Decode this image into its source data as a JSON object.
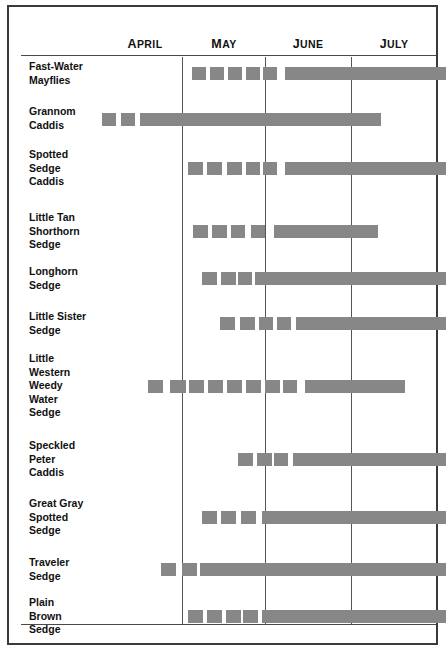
{
  "chart_data": {
    "type": "table",
    "title": "",
    "subtitle": "",
    "xlabel": "",
    "ylabel": "",
    "grid": true,
    "legend": null,
    "axis": {
      "months": [
        "April",
        "May",
        "June",
        "July"
      ],
      "month_labels": [
        "APRIL",
        "MAY",
        "JUNE",
        "JULY"
      ],
      "x_start_month": "April",
      "x_end_month": "July"
    },
    "note": "Emergence / hatch timing chart. Dashed (segmented) blocks indicate sparse or early emergence; solid blocks indicate peak continuous emergence.",
    "rows": [
      {
        "label": "Fast-Water\nMayflies",
        "dashes": [
          {
            "x": 183,
            "w": 14
          },
          {
            "x": 201,
            "w": 14
          },
          {
            "x": 219,
            "w": 14
          },
          {
            "x": 237,
            "w": 14
          },
          {
            "x": 254,
            "w": 14
          }
        ],
        "solid": {
          "x": 276,
          "w": 161
        }
      },
      {
        "label": "Grannom\nCaddis",
        "dashes": [
          {
            "x": 93,
            "w": 14
          },
          {
            "x": 112,
            "w": 14
          }
        ],
        "solid": {
          "x": 131,
          "w": 241
        }
      },
      {
        "label": "Spotted\nSedge\nCaddis",
        "dashes": [
          {
            "x": 179,
            "w": 15
          },
          {
            "x": 198,
            "w": 15
          },
          {
            "x": 218,
            "w": 15
          },
          {
            "x": 237,
            "w": 14
          },
          {
            "x": 254,
            "w": 14
          }
        ],
        "solid": {
          "x": 276,
          "w": 161
        }
      },
      {
        "label": "Little Tan\nShorthorn\nSedge",
        "dashes": [
          {
            "x": 184,
            "w": 15
          },
          {
            "x": 203,
            "w": 15
          },
          {
            "x": 222,
            "w": 14
          },
          {
            "x": 242,
            "w": 14
          }
        ],
        "solid": {
          "x": 265,
          "w": 104
        }
      },
      {
        "label": "Longhorn\nSedge",
        "dashes": [
          {
            "x": 193,
            "w": 15
          },
          {
            "x": 212,
            "w": 15
          },
          {
            "x": 229,
            "w": 14
          }
        ],
        "solid": {
          "x": 246,
          "w": 191
        }
      },
      {
        "label": "Little Sister\nSedge",
        "dashes": [
          {
            "x": 211,
            "w": 15
          },
          {
            "x": 231,
            "w": 15
          },
          {
            "x": 250,
            "w": 14
          },
          {
            "x": 268,
            "w": 14
          }
        ],
        "solid": {
          "x": 287,
          "w": 150
        }
      },
      {
        "label": "Little\nWestern\nWeedy\nWater\nSedge",
        "dashes": [
          {
            "x": 139,
            "w": 15
          },
          {
            "x": 161,
            "w": 16
          },
          {
            "x": 180,
            "w": 15
          },
          {
            "x": 199,
            "w": 15
          },
          {
            "x": 218,
            "w": 15
          },
          {
            "x": 237,
            "w": 15
          },
          {
            "x": 256,
            "w": 15
          },
          {
            "x": 274,
            "w": 14
          }
        ],
        "solid": {
          "x": 296,
          "w": 100
        }
      },
      {
        "label": "Speckled\nPeter\nCaddis",
        "dashes": [
          {
            "x": 229,
            "w": 15
          },
          {
            "x": 248,
            "w": 15
          },
          {
            "x": 265,
            "w": 14
          }
        ],
        "solid": {
          "x": 284,
          "w": 153
        }
      },
      {
        "label": "Great Gray\nSpotted\nSedge",
        "dashes": [
          {
            "x": 193,
            "w": 15
          },
          {
            "x": 212,
            "w": 15
          },
          {
            "x": 232,
            "w": 15
          }
        ],
        "solid": {
          "x": 253,
          "w": 184
        }
      },
      {
        "label": "Traveler\nSedge",
        "dashes": [
          {
            "x": 152,
            "w": 15
          },
          {
            "x": 173,
            "w": 15
          },
          {
            "x": 191,
            "w": 14
          }
        ],
        "solid": {
          "x": 203,
          "w": 234
        }
      },
      {
        "label": "Plain\nBrown\nSedge",
        "dashes": [
          {
            "x": 179,
            "w": 15
          },
          {
            "x": 198,
            "w": 15
          },
          {
            "x": 217,
            "w": 15
          },
          {
            "x": 234,
            "w": 15
          }
        ],
        "solid": {
          "x": 253,
          "w": 184
        }
      }
    ]
  },
  "header": {
    "months": [
      {
        "label": "APRIL",
        "x": 136
      },
      {
        "label": "MAY",
        "x": 215
      },
      {
        "label": "JUNE",
        "x": 299
      },
      {
        "label": "JULY",
        "x": 385
      }
    ]
  },
  "gridlines": [
    173,
    256,
    342
  ],
  "rows": [
    {
      "name": "fast-water-mayflies",
      "label": "Fast-Water\nMayflies",
      "label_y": 53,
      "bar_y": 60
    },
    {
      "name": "grannom-caddis",
      "label": "Grannom\nCaddis",
      "label_y": 98,
      "bar_y": 106
    },
    {
      "name": "spotted-sedge-caddis",
      "label": "Spotted\nSedge\nCaddis",
      "label_y": 141,
      "bar_y": 155
    },
    {
      "name": "little-tan-shorthorn-sedge",
      "label": "Little Tan\nShorthorn\nSedge",
      "label_y": 204,
      "bar_y": 218
    },
    {
      "name": "longhorn-sedge",
      "label": "Longhorn\nSedge",
      "label_y": 258,
      "bar_y": 265
    },
    {
      "name": "little-sister-sedge",
      "label": "Little Sister\nSedge",
      "label_y": 303,
      "bar_y": 310
    },
    {
      "name": "little-western-weedy-water-sedge",
      "label": "Little\nWestern\nWeedy\nWater\nSedge",
      "label_y": 345,
      "bar_y": 373
    },
    {
      "name": "speckled-peter-caddis",
      "label": "Speckled\nPeter\nCaddis",
      "label_y": 432,
      "bar_y": 446
    },
    {
      "name": "great-gray-spotted-sedge",
      "label": "Great Gray\nSpotted\nSedge",
      "label_y": 490,
      "bar_y": 504
    },
    {
      "name": "traveler-sedge",
      "label": "Traveler\nSedge",
      "label_y": 549,
      "bar_y": 556
    },
    {
      "name": "plain-brown-sedge",
      "label": "Plain\nBrown\nSedge",
      "label_y": 589,
      "bar_y": 603
    }
  ],
  "colors": {
    "bar": "#878787",
    "border": "#3a3a3a",
    "gridline": "#555555",
    "text": "#111111",
    "background": "#ffffff"
  }
}
